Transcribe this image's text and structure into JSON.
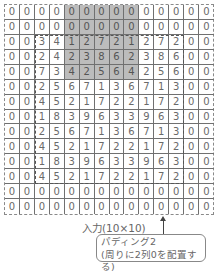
{
  "diagram": {
    "grid": [
      [
        "0",
        "0",
        "0",
        "0",
        "0",
        "0",
        "0",
        "0",
        "0",
        "0",
        "0",
        "0",
        "0",
        "0"
      ],
      [
        "0",
        "0",
        "0",
        "0",
        "0",
        "0",
        "0",
        "0",
        "0",
        "0",
        "0",
        "0",
        "0",
        "0"
      ],
      [
        "0",
        "0",
        "3",
        "4",
        "1",
        "2",
        "7",
        "2",
        "1",
        "2",
        "7",
        "2",
        "0",
        "0"
      ],
      [
        "0",
        "0",
        "2",
        "4",
        "2",
        "3",
        "8",
        "6",
        "2",
        "3",
        "8",
        "6",
        "0",
        "0"
      ],
      [
        "0",
        "0",
        "7",
        "3",
        "4",
        "2",
        "5",
        "6",
        "4",
        "2",
        "5",
        "6",
        "0",
        "0"
      ],
      [
        "0",
        "0",
        "2",
        "5",
        "6",
        "7",
        "1",
        "3",
        "6",
        "7",
        "1",
        "3",
        "0",
        "0"
      ],
      [
        "0",
        "0",
        "4",
        "5",
        "2",
        "1",
        "7",
        "2",
        "2",
        "1",
        "7",
        "2",
        "0",
        "0"
      ],
      [
        "0",
        "0",
        "1",
        "8",
        "3",
        "9",
        "6",
        "3",
        "3",
        "9",
        "6",
        "3",
        "0",
        "0"
      ],
      [
        "0",
        "0",
        "2",
        "5",
        "6",
        "7",
        "1",
        "3",
        "6",
        "7",
        "1",
        "3",
        "0",
        "0"
      ],
      [
        "0",
        "0",
        "4",
        "5",
        "2",
        "1",
        "7",
        "2",
        "2",
        "1",
        "7",
        "2",
        "0",
        "0"
      ],
      [
        "0",
        "0",
        "1",
        "8",
        "3",
        "9",
        "6",
        "3",
        "3",
        "9",
        "6",
        "3",
        "0",
        "0"
      ],
      [
        "0",
        "0",
        "4",
        "5",
        "2",
        "1",
        "7",
        "2",
        "2",
        "1",
        "7",
        "2",
        "0",
        "0"
      ],
      [
        "0",
        "0",
        "0",
        "0",
        "0",
        "0",
        "0",
        "0",
        "0",
        "0",
        "0",
        "0",
        "0",
        "0"
      ],
      [
        "0",
        "0",
        "0",
        "0",
        "0",
        "0",
        "0",
        "0",
        "0",
        "0",
        "0",
        "0",
        "0",
        "0"
      ]
    ],
    "shaded_region": {
      "row_start": 0,
      "row_end": 4,
      "col_start": 4,
      "col_end": 8
    },
    "input_label": "入力(10×10)",
    "callout_line1": "パディング2",
    "callout_line2": "(周りに2列0を配置する)",
    "colors": {
      "shade": "#bcbcbc",
      "line": "#707070",
      "text": "#6a6a6a"
    }
  }
}
